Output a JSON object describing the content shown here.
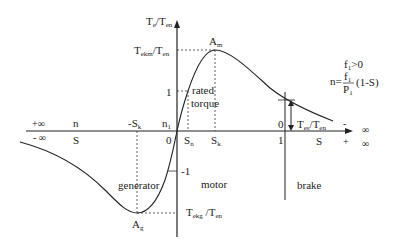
{
  "diagram": {
    "axes": {
      "y_label": "Te/Ten",
      "x_label_n": "n",
      "x_label_s": "S",
      "left_plus_inf": "+∞",
      "left_minus_inf": "- ∞",
      "right_minus_inf": "- ∞",
      "right_plus_inf": "+ ∞"
    },
    "points": {
      "peak_motor": {
        "label": "Am",
        "sub": "m",
        "base": "A"
      },
      "peak_generator": {
        "label": "Ag",
        "sub": "g",
        "base": "A"
      }
    },
    "y_ticks": {
      "max": "Tekm/Ten",
      "one": "1",
      "minus_one": "-1",
      "min": "Tekg/Ten",
      "start": "Tes/Ten"
    },
    "x_ticks": {
      "minus_sk": "-Sk",
      "n1": "n1",
      "zero": "0",
      "sn": "Sn",
      "sk": "Sk",
      "brake_zero": "0",
      "brake_one": "1"
    },
    "region_labels": {
      "generator": "generator",
      "motor": "motor",
      "brake": "brake",
      "rated_line1": "rated",
      "rated_line2": "torque"
    },
    "formula": {
      "condition": "f1>0",
      "n_eq": "n=",
      "numerator": "f1",
      "denominator": "P1",
      "tail": "(1-S)"
    }
  }
}
